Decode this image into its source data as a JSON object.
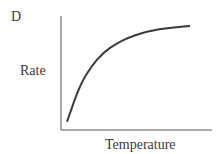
{
  "panel_label": "D",
  "chart_data": {
    "type": "line",
    "title": "",
    "panel": "D",
    "xlabel": "Temperature",
    "ylabel": "Rate",
    "x_ticks": [],
    "y_ticks": [],
    "grid": false,
    "legend": null,
    "series": [
      {
        "name": "Rate vs Temperature",
        "shape": "saturating (logarithmic-like) increase, rising steeply then leveling off",
        "x": [
          0,
          0.1,
          0.2,
          0.3,
          0.4,
          0.5,
          0.6,
          0.7,
          0.8,
          0.9,
          1.0
        ],
        "y": [
          0.06,
          0.4,
          0.6,
          0.73,
          0.81,
          0.87,
          0.91,
          0.94,
          0.96,
          0.97,
          0.98
        ]
      }
    ]
  }
}
